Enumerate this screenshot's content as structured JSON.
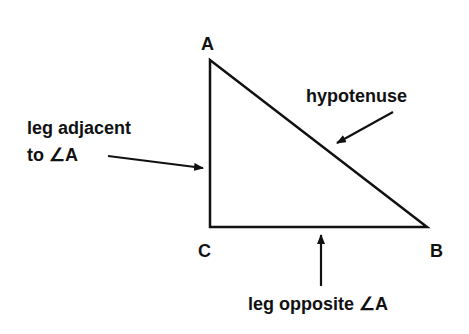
{
  "diagram": {
    "type": "right-triangle",
    "vertices": {
      "A": {
        "label": "A",
        "x": 210,
        "y": 60
      },
      "C": {
        "label": "C",
        "x": 210,
        "y": 227
      },
      "B": {
        "label": "B",
        "x": 427,
        "y": 227
      }
    },
    "annotations": {
      "hypotenuse": "hypotenuse",
      "adjacent_line1": "leg adjacent",
      "adjacent_line2": "to ∠A",
      "opposite": "leg opposite ∠A"
    },
    "colors": {
      "stroke": "#111111",
      "background": "#ffffff"
    }
  }
}
